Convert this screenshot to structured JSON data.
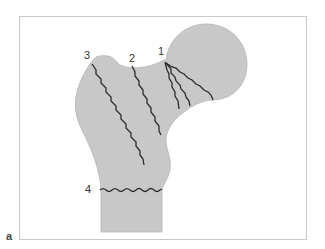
{
  "figure": {
    "panel_label": "a",
    "colors": {
      "bone_fill": "#c8c8c8",
      "bone_outline": "#b5b5b5",
      "fracture_line": "#2b2b2b",
      "frame": "#c9c9c9",
      "background": "#ffffff"
    },
    "fracture_labels": [
      {
        "id": "1",
        "text": "1",
        "x": 161,
        "y": 46
      },
      {
        "id": "2",
        "text": "2",
        "x": 129,
        "y": 53
      },
      {
        "id": "3",
        "text": "3",
        "x": 84,
        "y": 50
      },
      {
        "id": "4",
        "text": "4",
        "x": 84,
        "y": 184
      }
    ]
  }
}
